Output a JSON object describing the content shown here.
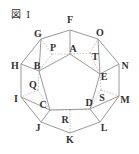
{
  "figure": {
    "title": "図 I",
    "outer_decagon": [
      {
        "label": "F",
        "x": 70,
        "y": 30,
        "lx": 70,
        "ly": 23
      },
      {
        "label": "O",
        "x": 98,
        "y": 39,
        "lx": 100,
        "ly": 36
      },
      {
        "label": "N",
        "x": 119,
        "y": 64,
        "lx": 125,
        "ly": 69
      },
      {
        "label": "M",
        "x": 119,
        "y": 96,
        "lx": 125,
        "ly": 103
      },
      {
        "label": "L",
        "x": 100,
        "y": 122,
        "lx": 104,
        "ly": 131
      },
      {
        "label": "K",
        "x": 70,
        "y": 133,
        "lx": 70,
        "ly": 143
      },
      {
        "label": "J",
        "x": 41,
        "y": 122,
        "lx": 38,
        "ly": 131
      },
      {
        "label": "I",
        "x": 21,
        "y": 97,
        "lx": 16,
        "ly": 102
      },
      {
        "label": "H",
        "x": 21,
        "y": 64,
        "lx": 15,
        "ly": 69
      },
      {
        "label": "G",
        "x": 41,
        "y": 39,
        "lx": 38,
        "ly": 37
      }
    ],
    "inner_pentagon": [
      {
        "label": "A",
        "x": 70,
        "y": 54,
        "lx": 73,
        "ly": 52
      },
      {
        "label": "E",
        "x": 100,
        "y": 74,
        "lx": 104,
        "ly": 80
      },
      {
        "label": "D",
        "x": 90,
        "y": 109,
        "lx": 89,
        "ly": 106
      },
      {
        "label": "C",
        "x": 50,
        "y": 110,
        "lx": 43,
        "ly": 108
      },
      {
        "label": "B",
        "x": 39,
        "y": 71,
        "lx": 37,
        "ly": 69
      }
    ],
    "dotted_points": [
      {
        "label": "P",
        "x": 52,
        "y": 54,
        "lx": 53,
        "ly": 51
      },
      {
        "label": "T",
        "x": 90,
        "y": 53,
        "lx": 95,
        "ly": 60
      },
      {
        "label": "S",
        "x": 101,
        "y": 90,
        "lx": 102,
        "ly": 101
      },
      {
        "label": "R",
        "x": 70,
        "y": 110,
        "lx": 65,
        "ly": 123
      },
      {
        "label": "Q",
        "x": 38,
        "y": 90,
        "lx": 33,
        "ly": 88
      }
    ],
    "line_color": "#9a9a9a",
    "dotted_color": "#b0b0b0",
    "label_color": "#333333"
  }
}
